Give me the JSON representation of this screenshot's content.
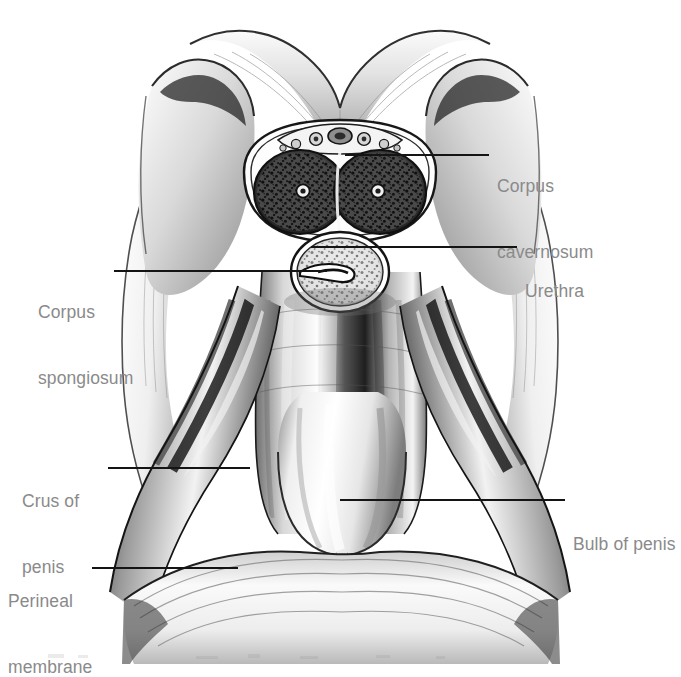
{
  "figure": {
    "medium": "pencil and wash medical illustration",
    "background_color": "#ffffff",
    "ink_color": "#141414",
    "label_color": "#8a8a8a"
  },
  "labels": [
    {
      "id": "corpus-cavernosum",
      "text": "Corpus\ncavernosum",
      "line1": "Corpus",
      "line2": "cavernosum",
      "side": "right",
      "text_x": 497,
      "text_y": 131,
      "leader": {
        "x1": 345,
        "y1": 155,
        "x2": 489,
        "y2": 155
      }
    },
    {
      "id": "urethra",
      "text": "Urethra",
      "line1": "Urethra",
      "line2": "",
      "side": "right",
      "text_x": 525,
      "text_y": 236,
      "leader": {
        "x1": 311,
        "y1": 247,
        "x2": 517,
        "y2": 247
      }
    },
    {
      "id": "corpus-spongiosum",
      "text": "Corpus\nspongiosum",
      "line1": "Corpus",
      "line2": "spongiosum",
      "side": "left",
      "text_x": 38,
      "text_y": 257,
      "leader": {
        "x1": 114,
        "y1": 271,
        "x2": 327,
        "y2": 271
      }
    },
    {
      "id": "crus-of-penis",
      "text": "Crus of\npenis",
      "line1": "Crus of",
      "line2": "penis",
      "side": "left",
      "text_x": 22,
      "text_y": 446,
      "leader": {
        "x1": 108,
        "y1": 468,
        "x2": 250,
        "y2": 468
      }
    },
    {
      "id": "bulb-of-penis",
      "text": "Bulb of penis",
      "line1": "Bulb of penis",
      "line2": "",
      "side": "right",
      "text_x": 573,
      "text_y": 489,
      "leader": {
        "x1": 340,
        "y1": 500,
        "x2": 565,
        "y2": 500
      }
    },
    {
      "id": "perineal-membrane",
      "text": "Perineal\nmembrane",
      "line1": "Perineal",
      "line2": "membrane",
      "side": "left",
      "text_x": 8,
      "text_y": 546,
      "leader": {
        "x1": 92,
        "y1": 568,
        "x2": 238,
        "y2": 568
      }
    }
  ],
  "structures": [
    {
      "id": "pubic-arch",
      "name": "pubic arch and suspensory ligament"
    },
    {
      "id": "corpus-cavernosum-left",
      "name": "left corpus cavernosum (sectioned)"
    },
    {
      "id": "corpus-cavernosum-right",
      "name": "right corpus cavernosum (sectioned)"
    },
    {
      "id": "deep-artery-left",
      "name": "left deep artery of penis"
    },
    {
      "id": "deep-artery-right",
      "name": "right deep artery of penis"
    },
    {
      "id": "dorsal-neurovascular-bundle",
      "name": "dorsal vein, arteries and nerves of penis"
    },
    {
      "id": "corpus-spongiosum-section",
      "name": "corpus spongiosum (sectioned)"
    },
    {
      "id": "urethral-lumen",
      "name": "urethral lumen"
    },
    {
      "id": "penile-shaft",
      "name": "shaft of penis"
    },
    {
      "id": "crus-left",
      "name": "left crus of penis"
    },
    {
      "id": "crus-right",
      "name": "right crus of penis"
    },
    {
      "id": "bulb",
      "name": "bulb of penis"
    },
    {
      "id": "perineal-membrane-sheet",
      "name": "perineal membrane"
    },
    {
      "id": "ischiopubic-ramus-left",
      "name": "left ischiopubic ramus"
    },
    {
      "id": "ischiopubic-ramus-right",
      "name": "right ischiopubic ramus"
    }
  ]
}
